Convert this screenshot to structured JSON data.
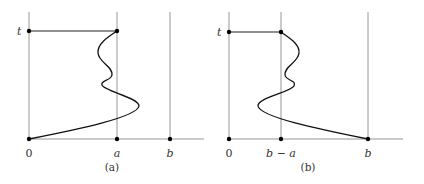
{
  "panels": [
    {
      "id": "a",
      "caption": "(a)",
      "y_label": "t",
      "x_labels": {
        "origin": "0",
        "mid": "a",
        "right": "b"
      }
    },
    {
      "id": "b",
      "caption": "(b)",
      "y_label": "t",
      "x_labels": {
        "origin": "0",
        "mid": "b − a",
        "right": "b"
      }
    }
  ]
}
